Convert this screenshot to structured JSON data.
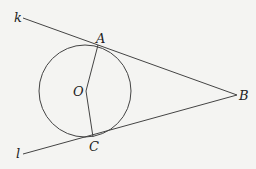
{
  "diagram": {
    "points": [
      {
        "id": "A",
        "label": "A"
      },
      {
        "id": "B",
        "label": "B"
      },
      {
        "id": "C",
        "label": "C"
      },
      {
        "id": "O",
        "label": "O"
      }
    ],
    "lines": [
      {
        "id": "k",
        "label": "k"
      },
      {
        "id": "l",
        "label": "l"
      }
    ],
    "segments": [
      "OA",
      "OC"
    ],
    "circle": {
      "center": "O"
    },
    "colors": {
      "stroke": "#444444",
      "background": "#f4f4f2",
      "text": "#222222"
    }
  }
}
